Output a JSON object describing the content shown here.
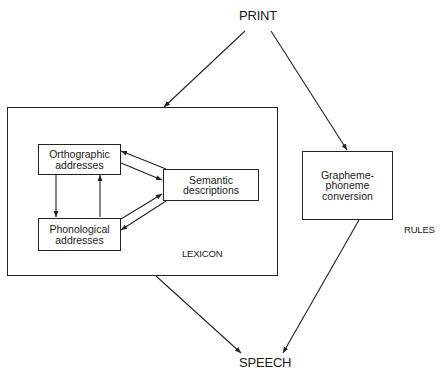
{
  "diagram": {
    "type": "dual-route model of reading",
    "nodes": {
      "print": {
        "label": "PRINT"
      },
      "speech": {
        "label": "SPEECH"
      },
      "lexicon": {
        "label": "LEXICON"
      },
      "rules": {
        "label": "RULES"
      },
      "orthographic": {
        "line1": "Orthographic",
        "line2": "addresses"
      },
      "phonological": {
        "line1": "Phonological",
        "line2": "addresses"
      },
      "semantic": {
        "line1": "Semantic",
        "line2": "descriptions"
      },
      "gpc": {
        "line1": "Grapheme-",
        "line2": "phoneme",
        "line3": "conversion"
      }
    },
    "edges": [
      {
        "from": "PRINT",
        "to": "LEXICON"
      },
      {
        "from": "PRINT",
        "to": "Grapheme-phoneme conversion"
      },
      {
        "from": "Orthographic addresses",
        "to": "Phonological addresses"
      },
      {
        "from": "Phonological addresses",
        "to": "Orthographic addresses"
      },
      {
        "from": "Orthographic addresses",
        "to": "Semantic descriptions"
      },
      {
        "from": "Semantic descriptions",
        "to": "Orthographic addresses"
      },
      {
        "from": "Phonological addresses",
        "to": "Semantic descriptions"
      },
      {
        "from": "Semantic descriptions",
        "to": "Phonological addresses"
      },
      {
        "from": "LEXICON",
        "to": "SPEECH"
      },
      {
        "from": "Grapheme-phoneme conversion",
        "to": "SPEECH"
      }
    ]
  }
}
